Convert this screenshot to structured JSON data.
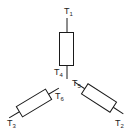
{
  "diagram": {
    "type": "star-connected three-phase winding",
    "terminals": [
      {
        "id": "T1",
        "letter": "T",
        "index": "1"
      },
      {
        "id": "T2",
        "letter": "T",
        "index": "2"
      },
      {
        "id": "T3",
        "letter": "T",
        "index": "3"
      },
      {
        "id": "T4",
        "letter": "T",
        "index": "4"
      },
      {
        "id": "T5",
        "letter": "T",
        "index": "5"
      },
      {
        "id": "T6",
        "letter": "T",
        "index": "6"
      }
    ],
    "windings": [
      {
        "name": "winding-1",
        "ends": [
          "T1",
          "T4"
        ],
        "orientation": "vertical"
      },
      {
        "name": "winding-2",
        "ends": [
          "T5",
          "T2"
        ],
        "orientation": "lower-right"
      },
      {
        "name": "winding-3",
        "ends": [
          "T6",
          "T3"
        ],
        "orientation": "lower-left"
      }
    ],
    "colors": {
      "stroke": "#1a1a1a",
      "background": "#ffffff"
    }
  }
}
